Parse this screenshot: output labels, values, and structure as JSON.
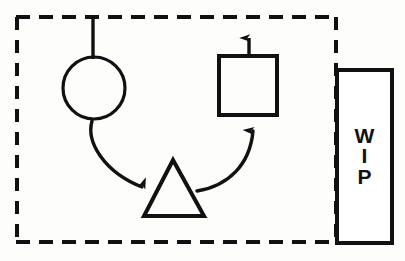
{
  "diagram": {
    "type": "flowchart-sketch",
    "background_color": "#fdfdfc",
    "stroke_color": "#111111",
    "canvas": {
      "width": 405,
      "height": 261
    },
    "boundary": {
      "name": "work-cell-boundary",
      "style": "dashed",
      "x": 16,
      "y": 17,
      "width": 321,
      "height": 226,
      "dash_length": 13,
      "dash_gap": 9,
      "stroke_width": 4
    },
    "nodes": [
      {
        "id": "circle-station",
        "shape": "circle",
        "label": "",
        "cx": 94,
        "cy": 88,
        "r": 31,
        "stroke_width": 3
      },
      {
        "id": "triangle-buffer",
        "shape": "triangle",
        "label": "",
        "apex_x": 173,
        "apex_y": 160,
        "base_left_x": 144,
        "base_right_x": 204,
        "base_y": 216,
        "stroke_width": 4
      },
      {
        "id": "square-station",
        "shape": "rectangle",
        "label": "",
        "x": 219,
        "y": 56,
        "width": 58,
        "height": 59,
        "stroke_width": 4
      },
      {
        "id": "wip-store",
        "shape": "rectangle",
        "label": "WIP",
        "label_lines": [
          "W",
          "I",
          "P"
        ],
        "label_font_size": 21,
        "x": 337,
        "y": 70,
        "width": 55,
        "height": 173,
        "stroke_width": 4
      }
    ],
    "connectors": [
      {
        "id": "input-line",
        "from": "boundary-top",
        "to": "circle-station",
        "style": "straight",
        "arrowhead": "none",
        "x1": 93,
        "y1": 19,
        "x2": 93,
        "y2": 58
      },
      {
        "id": "circle-to-triangle",
        "from": "circle-station",
        "to": "triangle-buffer",
        "style": "curved",
        "arrowhead": "end",
        "direction": "right"
      },
      {
        "id": "triangle-to-square",
        "from": "triangle-buffer",
        "to": "square-station",
        "style": "curved",
        "arrowhead": "end",
        "direction": "up"
      },
      {
        "id": "square-output",
        "from": "square-station",
        "to": "boundary-top",
        "style": "straight",
        "arrowhead": "end",
        "direction": "up",
        "x1": 249,
        "y1": 57,
        "x2": 249,
        "y2": 26
      }
    ]
  }
}
